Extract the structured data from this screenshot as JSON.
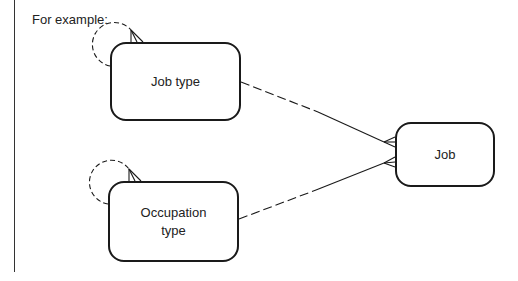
{
  "caption": "For example:",
  "entities": {
    "job_type": {
      "label": "Job type"
    },
    "occupation_type": {
      "label": "Occupation\ntype"
    },
    "job": {
      "label": "Job"
    }
  },
  "relationships": [
    {
      "from": "job_type",
      "to": "job_type",
      "kind": "recursive",
      "style": "dashed-optional",
      "cardinality": "one-to-many"
    },
    {
      "from": "occupation_type",
      "to": "occupation_type",
      "kind": "recursive",
      "style": "dashed-optional",
      "cardinality": "one-to-many"
    },
    {
      "from": "job_type",
      "to": "job",
      "style": "half-dashed",
      "cardinality": "one-to-many"
    },
    {
      "from": "occupation_type",
      "to": "job",
      "style": "half-dashed",
      "cardinality": "one-to-many"
    }
  ],
  "colors": {
    "line": "#1a1a1a",
    "background": "#ffffff"
  }
}
